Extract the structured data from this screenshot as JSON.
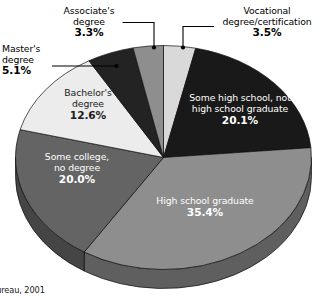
{
  "source_note": "s Bureau, 2001",
  "chart_data": {
    "type": "pie",
    "title": "",
    "subtitle": "",
    "xlabel": "",
    "ylabel": "",
    "legend_position": "none",
    "grid": false,
    "three_d": true,
    "start_angle_deg": 0,
    "direction": "clockwise",
    "categories": [
      "Vocational degree/certification",
      "Some high school, not high school graduate",
      "High school graduate",
      "Some college, no degree",
      "Bachelor's degree",
      "Master's degree",
      "Associate's degree"
    ],
    "values": [
      3.5,
      20.1,
      35.4,
      20.0,
      12.6,
      5.1,
      3.3
    ],
    "slices": [
      {
        "label_line1": "Vocational",
        "label_line2": "degree/certification",
        "percent_text": "3.5%",
        "value": 3.5,
        "color": "#d9d9d9",
        "side_color": "#a8a8a8",
        "label_placement": "external"
      },
      {
        "label_line1": "Some high school, not",
        "label_line2": "high school graduate",
        "percent_text": "20.1%",
        "value": 20.1,
        "color": "#191919",
        "side_color": "#101010",
        "label_placement": "internal"
      },
      {
        "label_line1": "High school graduate",
        "label_line2": "",
        "percent_text": "35.4%",
        "value": 35.4,
        "color": "#8e8e8e",
        "side_color": "#5f5f5f",
        "label_placement": "internal"
      },
      {
        "label_line1": "Some college,",
        "label_line2": "no degree",
        "percent_text": "20.0%",
        "value": 20.0,
        "color": "#646464",
        "side_color": "#454545",
        "label_placement": "internal"
      },
      {
        "label_line1": "Bachelor's",
        "label_line2": "degree",
        "percent_text": "12.6%",
        "value": 12.6,
        "color": "#ececec",
        "side_color": "#b4b4b4",
        "label_placement": "internal"
      },
      {
        "label_line1": "Master's",
        "label_line2": "degree",
        "percent_text": "5.1%",
        "value": 5.1,
        "color": "#232323",
        "side_color": "#161616",
        "label_placement": "external"
      },
      {
        "label_line1": "Associate's",
        "label_line2": "degree",
        "percent_text": "3.3%",
        "value": 3.3,
        "color": "#8e8e8e",
        "side_color": "#5f5f5f",
        "label_placement": "external"
      }
    ]
  },
  "labels": {
    "associates": {
      "line1": "Associate's",
      "line2": "degree",
      "pct": "3.3%"
    },
    "vocational": {
      "line1": "Vocational",
      "line2": "degree/certification",
      "pct": "3.5%"
    },
    "masters": {
      "line1": "Master's",
      "line2": "degree",
      "pct": "5.1%"
    },
    "bachelors": {
      "line1": "Bachelor's",
      "line2": "degree",
      "pct": "12.6%"
    },
    "some_college": {
      "line1": "Some college,",
      "line2": "no degree",
      "pct": "20.0%"
    },
    "some_high_school": {
      "line1": "Some high school, not",
      "line2": "high school graduate",
      "pct": "20.1%"
    },
    "high_school_grad": {
      "line1": "High school graduate",
      "line2": "",
      "pct": "35.4%"
    }
  }
}
